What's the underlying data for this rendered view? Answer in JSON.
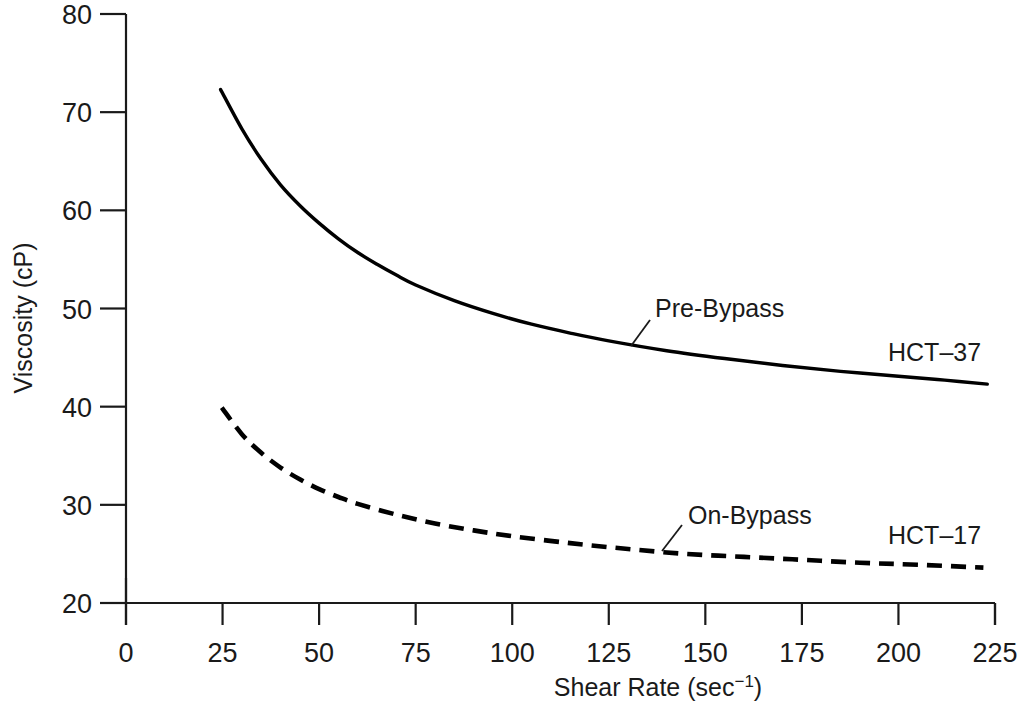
{
  "chart_data": {
    "type": "line",
    "title": "",
    "xlabel": "Shear Rate (sec−1)",
    "ylabel": "Viscosity (cP)",
    "xlim": [
      0,
      225
    ],
    "ylim": [
      20,
      80
    ],
    "grid": false,
    "legend_position": "inline-annotations",
    "xticks": [
      0,
      25,
      50,
      75,
      100,
      125,
      150,
      175,
      200,
      225
    ],
    "xtick_labels": [
      "0",
      "25",
      "50",
      "75",
      "100",
      "125",
      "150",
      "175",
      "200",
      "225"
    ],
    "yticks": [
      20,
      30,
      40,
      50,
      60,
      70,
      80
    ],
    "ytick_labels": [
      "20",
      "30",
      "40",
      "50",
      "60",
      "70",
      "80"
    ],
    "series": [
      {
        "name": "Pre-Bypass",
        "hct_label": "HCT–37",
        "style": "solid",
        "color": "#000000",
        "x": [
          24.5,
          30,
          35,
          40,
          45,
          50,
          55,
          60,
          65,
          70,
          75,
          85,
          95,
          105,
          115,
          125,
          140,
          155,
          170,
          185,
          200,
          212,
          223
        ],
        "y": [
          72.3,
          68.3,
          65.2,
          62.6,
          60.5,
          58.7,
          57.1,
          55.7,
          54.5,
          53.4,
          52.4,
          50.8,
          49.5,
          48.4,
          47.5,
          46.7,
          45.7,
          44.9,
          44.2,
          43.6,
          43.1,
          42.7,
          42.3
        ]
      },
      {
        "name": "On-Bypass",
        "hct_label": "HCT–17",
        "style": "dashed",
        "color": "#000000",
        "x": [
          24.8,
          30,
          35,
          40,
          45,
          50,
          55,
          60,
          70,
          80,
          90,
          100,
          115,
          130,
          145,
          160,
          175,
          190,
          205,
          222
        ],
        "y": [
          39.9,
          37.2,
          35.3,
          33.8,
          32.6,
          31.6,
          30.8,
          30.1,
          29.0,
          28.1,
          27.4,
          26.8,
          26.1,
          25.5,
          25.0,
          24.7,
          24.4,
          24.1,
          23.9,
          23.6
        ]
      }
    ],
    "annotations": [
      {
        "text": "Pre-Bypass",
        "series": "Pre-Bypass",
        "x": 25.0,
        "y": 105.0
      },
      {
        "text": "On-Bypass",
        "series": "On-Bypass",
        "x": 25.0,
        "y": 105.0
      },
      {
        "text": "HCT–37",
        "series": "Pre-Bypass",
        "x": 25.0,
        "y": 105.0
      },
      {
        "text": "HCT–17",
        "series": "On-Bypass",
        "x": 25.0,
        "y": 105.0
      }
    ]
  },
  "axis": {
    "x_title_main": "Shear Rate (sec",
    "x_title_sup": "−1",
    "x_title_close": ")",
    "y_title": "Viscosity (cP)"
  },
  "colors": {
    "axis": "#1a1a1a",
    "curve": "#000000",
    "background": "#ffffff"
  }
}
